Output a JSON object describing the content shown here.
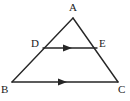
{
  "figure": {
    "type": "geometry-diagram",
    "shape": "triangle",
    "width": 130,
    "height": 101,
    "background_color": "#ffffff",
    "stroke_color": "#262626",
    "label_color": "#1a1a1a",
    "stroke_width": 1.4,
    "vertices": [
      {
        "name": "A",
        "label": "A",
        "x": 73,
        "y": 18,
        "label_x": 69,
        "label_y": 2
      },
      {
        "name": "B",
        "label": "B",
        "x": 12,
        "y": 82,
        "label_x": 1,
        "label_y": 84
      },
      {
        "name": "C",
        "label": "C",
        "x": 118,
        "y": 82,
        "label_x": 118,
        "label_y": 84
      },
      {
        "name": "D",
        "label": "D",
        "x": 43,
        "y": 48,
        "label_x": 31,
        "label_y": 38
      },
      {
        "name": "E",
        "label": "E",
        "x": 97,
        "y": 48,
        "label_x": 99,
        "label_y": 38
      }
    ],
    "edges": [
      {
        "name": "side-AB",
        "from": "A",
        "to": "B",
        "x1": 73,
        "y1": 18,
        "x2": 12,
        "y2": 82
      },
      {
        "name": "side-AC",
        "from": "A",
        "to": "C",
        "x1": 73,
        "y1": 18,
        "x2": 118,
        "y2": 82
      },
      {
        "name": "side-BC",
        "from": "B",
        "to": "C",
        "x1": 12,
        "y1": 82,
        "x2": 118,
        "y2": 82
      },
      {
        "name": "segment-DE",
        "from": "D",
        "to": "E",
        "x1": 43,
        "y1": 48,
        "x2": 97,
        "y2": 48
      }
    ],
    "parallel_marks": [
      {
        "name": "arrow-on-DE",
        "segment": "segment-DE",
        "x": 70,
        "y": 48,
        "direction": "right",
        "count": 1
      },
      {
        "name": "arrow-on-BC",
        "segment": "side-BC",
        "x": 65,
        "y": 82,
        "direction": "right",
        "count": 1
      }
    ]
  }
}
